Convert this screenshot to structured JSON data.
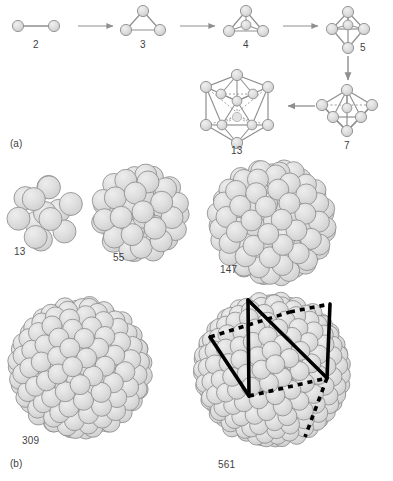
{
  "figure": {
    "background_color": "#ffffff",
    "sphere_fill": "#dcdcdc",
    "sphere_stroke": "#8c8c8c",
    "bond_color": "#8f8f8f",
    "dashed_bond_color": "#a8a8a8",
    "arrow_color": "#8f8f8f",
    "overlay_color": "#000000",
    "label_color": "#3f3f3f"
  },
  "panels": [
    {
      "id": "a",
      "label": "(a)",
      "description": "Ball-and-stick polyhedral cluster growth sequence",
      "label_x": 10,
      "label_y": 140,
      "nodes": [
        {
          "name": "dimer",
          "count": "2",
          "label_x": 33,
          "label_y": 40,
          "cx": 36,
          "cy": 26,
          "kind": "ball-stick"
        },
        {
          "name": "triangle",
          "count": "3",
          "label_x": 140,
          "label_y": 40,
          "cx": 143,
          "cy": 24,
          "kind": "ball-stick"
        },
        {
          "name": "tetrahedron",
          "count": "4",
          "label_x": 243,
          "label_y": 40,
          "cx": 246,
          "cy": 24,
          "kind": "ball-stick"
        },
        {
          "name": "trigonal-bipyramid",
          "count": "5",
          "label_x": 364,
          "label_y": 42,
          "cx": 348,
          "cy": 30,
          "kind": "ball-stick"
        },
        {
          "name": "pentagonal-bipyramid",
          "count": "7",
          "label_x": 344,
          "label_y": 140,
          "cx": 347,
          "cy": 108,
          "kind": "ball-stick"
        },
        {
          "name": "icosahedron",
          "count": "13",
          "label_x": 227,
          "label_y": 143,
          "cx": 237,
          "cy": 108,
          "kind": "ball-stick"
        }
      ],
      "arrows": [
        {
          "name": "arrow-2-to-3",
          "from": "2",
          "to": "3",
          "direction": "right"
        },
        {
          "name": "arrow-3-to-4",
          "from": "3",
          "to": "4",
          "direction": "right"
        },
        {
          "name": "arrow-4-to-5",
          "from": "4",
          "to": "5",
          "direction": "right"
        },
        {
          "name": "arrow-5-to-7",
          "from": "5",
          "to": "7",
          "direction": "down"
        },
        {
          "name": "arrow-7-to-13",
          "from": "7",
          "to": "13",
          "direction": "left"
        }
      ]
    },
    {
      "id": "b",
      "label": "(b)",
      "description": "Space-filling magic-number icosahedral clusters",
      "label_x": 10,
      "label_y": 462,
      "clusters": [
        {
          "name": "cluster-13",
          "count": "13",
          "label_x": 14,
          "label_y": 250,
          "cx": 45,
          "cy": 213,
          "radius": 28,
          "shells": 1,
          "sphere_r": 11.5,
          "overlay": false
        },
        {
          "name": "cluster-55",
          "count": "55",
          "label_x": 113,
          "label_y": 255,
          "cx": 140,
          "cy": 213,
          "radius": 40,
          "shells": 2,
          "sphere_r": 11.0,
          "overlay": false
        },
        {
          "name": "cluster-147",
          "count": "147",
          "label_x": 220,
          "label_y": 267,
          "cx": 272,
          "cy": 222,
          "radius": 55,
          "shells": 3,
          "sphere_r": 10.5,
          "overlay": false
        },
        {
          "name": "cluster-309",
          "count": "309",
          "label_x": 22,
          "label_y": 438,
          "cx": 80,
          "cy": 368,
          "radius": 63,
          "shells": 4,
          "sphere_r": 10.0,
          "overlay": false
        },
        {
          "name": "cluster-561",
          "count": "561",
          "label_x": 218,
          "label_y": 462,
          "cx": 272,
          "cy": 370,
          "radius": 70,
          "shells": 5,
          "sphere_r": 9.5,
          "overlay": true
        }
      ],
      "overlay_note": "Icosahedral wireframe drawn over the 561-atom cluster using solid and dashed black lines"
    }
  ]
}
